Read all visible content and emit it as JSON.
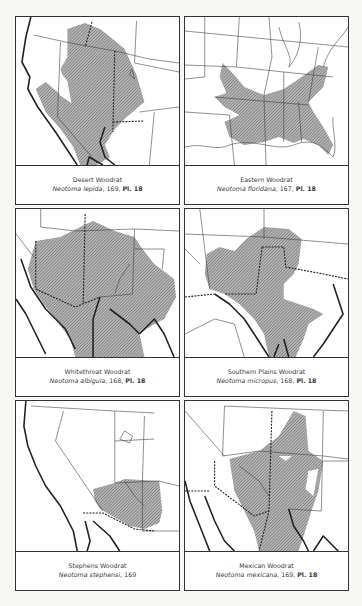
{
  "panels": [
    {
      "common_name": "Desert Woodrat",
      "scientific_name": "Neotoma lepida",
      "page": "169",
      "plate": "Pl. 18"
    },
    {
      "common_name": "Eastern Woodrat",
      "scientific_name": "Neotoma floridana",
      "page": "167",
      "plate": "Pl. 18"
    },
    {
      "common_name": "Whitethroat Woodrat",
      "scientific_name": "Neotoma albigula",
      "page": "168",
      "plate": "Pl. 18"
    },
    {
      "common_name": "Southern Plains Woodrat",
      "scientific_name": "Neotoma micropus",
      "page": "168",
      "plate": "Pl. 18"
    },
    {
      "common_name": "Stephens Woodrat",
      "scientific_name": "Neotoma stephensi",
      "page": "169",
      "plate": null
    },
    {
      "common_name": "Mexican Woodrat",
      "scientific_name": "Neotoma mexicana",
      "page": "169",
      "plate": "Pl. 18"
    }
  ],
  "colors": {
    "range_hatch": "#6f6f6f",
    "range_fill": "#a9a9a9",
    "border": "#333333",
    "background": "#ffffff"
  }
}
